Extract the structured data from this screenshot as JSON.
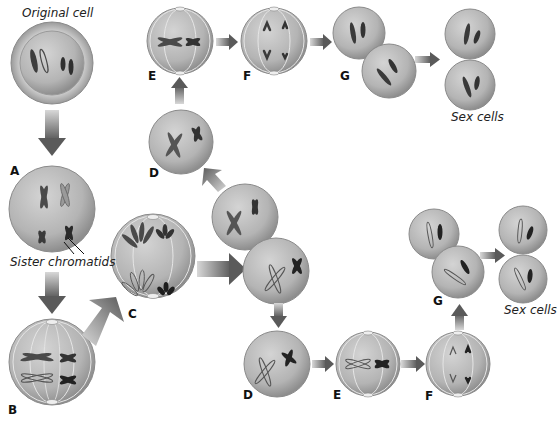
{
  "diagram": {
    "captions": {
      "original_cell": "Original cell",
      "sister_chromatids": "Sister chromatids",
      "sex_cells_top": "Sex cells",
      "sex_cells_bottom": "Sex cells"
    },
    "stage_labels": {
      "A": "A",
      "B": "B",
      "C": "C",
      "D_top": "D",
      "E_top": "E",
      "F_top": "F",
      "G_top": "G",
      "D_bottom": "D",
      "E_bottom": "E",
      "F_bottom": "F",
      "G_bottom": "G"
    },
    "colors": {
      "cell_fill": "#b8b8b8",
      "cell_edge": "#8a8a8a",
      "chromosome_dark": "#3a3a3a",
      "chromosome_mid": "#6a6a6a",
      "arrow": "#6d6d6d",
      "spindle": "#e6e6e6"
    }
  }
}
